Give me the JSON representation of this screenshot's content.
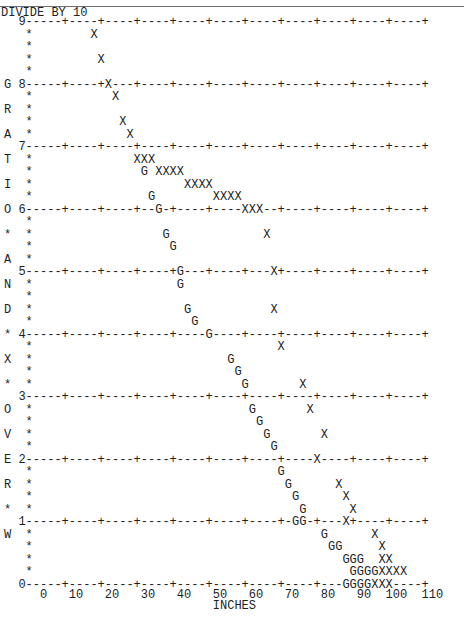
{
  "header": {
    "title": "DIVIDE BY 10"
  },
  "chart_data": {
    "type": "scatter",
    "title": "DIVIDE BY 10",
    "xlabel": "INCHES",
    "ylabel": "GRATIO*AND*X*OVER*W",
    "x_ticks": [
      "0",
      "10",
      "20",
      "30",
      "40",
      "50",
      "60",
      "70",
      "80",
      "90",
      "100",
      "110"
    ],
    "y_ticks": [
      "9",
      "8",
      "7",
      "6",
      "5",
      "4",
      "3",
      "2",
      "1",
      "0"
    ],
    "xlim": [
      0,
      120
    ],
    "ylim": [
      0,
      9
    ],
    "grid": true,
    "legend": null,
    "series": [
      {
        "name": "X",
        "points": [
          [
            16,
            8.8
          ],
          [
            18,
            8.4
          ],
          [
            20,
            8.0
          ],
          [
            22,
            7.8
          ],
          [
            24,
            7.4
          ],
          [
            26,
            7.2
          ],
          [
            28,
            6.8
          ],
          [
            30,
            6.8
          ],
          [
            32,
            6.8
          ],
          [
            34,
            6.6
          ],
          [
            36,
            6.6
          ],
          [
            38,
            6.6
          ],
          [
            40,
            6.6
          ],
          [
            42,
            6.4
          ],
          [
            44,
            6.4
          ],
          [
            46,
            6.4
          ],
          [
            48,
            6.4
          ],
          [
            50,
            6.2
          ],
          [
            52,
            6.2
          ],
          [
            54,
            6.2
          ],
          [
            56,
            6.2
          ],
          [
            58,
            6.0
          ],
          [
            60,
            6.0
          ],
          [
            62,
            6.0
          ],
          [
            64,
            5.6
          ],
          [
            66,
            5.0
          ],
          [
            68,
            4.6
          ],
          [
            70,
            3.8
          ],
          [
            72,
            3.2
          ],
          [
            74,
            2.8
          ],
          [
            76,
            2.4
          ],
          [
            78,
            2.0
          ],
          [
            80,
            1.6
          ],
          [
            82,
            1.4
          ],
          [
            84,
            1.2
          ],
          [
            86,
            1.0
          ],
          [
            88,
            0.8
          ],
          [
            90,
            0.6
          ],
          [
            92,
            0.4
          ],
          [
            94,
            0.4
          ],
          [
            98,
            0.2
          ],
          [
            100,
            0.2
          ],
          [
            102,
            0.2
          ],
          [
            104,
            0.2
          ],
          [
            104,
            0.0
          ],
          [
            106,
            0.0
          ],
          [
            108,
            0.0
          ]
        ]
      },
      {
        "name": "G",
        "points": [
          [
            30,
            6.6
          ],
          [
            32,
            6.2
          ],
          [
            34,
            6.0
          ],
          [
            36,
            5.6
          ],
          [
            38,
            5.4
          ],
          [
            40,
            5.0
          ],
          [
            42,
            4.8
          ],
          [
            44,
            4.4
          ],
          [
            46,
            4.2
          ],
          [
            48,
            4.0
          ],
          [
            50,
            3.6
          ],
          [
            52,
            3.4
          ],
          [
            54,
            3.2
          ],
          [
            56,
            2.8
          ],
          [
            58,
            2.6
          ],
          [
            60,
            2.4
          ],
          [
            62,
            2.2
          ],
          [
            64,
            1.8
          ],
          [
            66,
            1.6
          ],
          [
            68,
            1.4
          ],
          [
            70,
            1.2
          ],
          [
            72,
            1.0
          ],
          [
            74,
            1.0
          ],
          [
            76,
            0.8
          ],
          [
            78,
            0.6
          ],
          [
            80,
            0.6
          ],
          [
            82,
            0.4
          ],
          [
            84,
            0.4
          ],
          [
            86,
            0.4
          ],
          [
            88,
            0.2
          ],
          [
            90,
            0.2
          ],
          [
            92,
            0.2
          ],
          [
            94,
            0.2
          ],
          [
            96,
            0.0
          ],
          [
            98,
            0.0
          ],
          [
            100,
            0.0
          ],
          [
            102,
            0.0
          ]
        ]
      }
    ]
  },
  "lines": [
    "   9-----+----+----+----+----+----+----+----+----+----+----+",
    "    *        X",
    "    *",
    "    *         X",
    "    *",
    " G 8-----+----+X---+----+----+----+----+----+----+----+----+",
    "    *           X",
    " R  *",
    "    *            X",
    " A  *             X",
    "   7-----+----+----+----+----+----+----+----+----+----+----+",
    " T  *              XXX",
    "    *               G XXXX",
    " I  *                     XXXX",
    "    *                G        XXXX",
    " O 6-----+----+----+--G-+----+----XXX--+----+----+----+----+",
    "    *",
    " *  *                  G             X",
    "    *                   G",
    " A  *",
    "   5-----+----+----+----+G---+----+---X+----+----+----+----+",
    " N  *                    G",
    "    *",
    " D  *                     G           X",
    "    *                      G",
    " * 4-----+----+----+----+----G----+----+----+----+----+----+",
    "    *                                  X",
    " X  *                           G",
    "    *                            G",
    " *  *                             G       X",
    "   3-----+----+----+----+----+----+----+----+----+----+----+",
    " O  *                              G       X",
    "    *                               G",
    " V  *                                G       X",
    "    *                                 G",
    " E 2-----+----+----+----+----+----+----+----X----+----+----+",
    "    *                                  G",
    " R  *                                   G      X",
    "    *                                    G      X",
    " *  *                                     G      X",
    "   1-----+----+----+----+----+----+----+-GG-+---X+----+----+",
    " W  *                                        G      X",
    "    *                                         GG     X",
    "    *                                           GGG  XX",
    "    *                                            GGGGXXXX",
    "   0-----+----+----+----+----+----+----+----+---GGGGXXX----+",
    "      0   10   20   30   40   50   60   70   80   90  100  110",
    "                              INCHES"
  ]
}
